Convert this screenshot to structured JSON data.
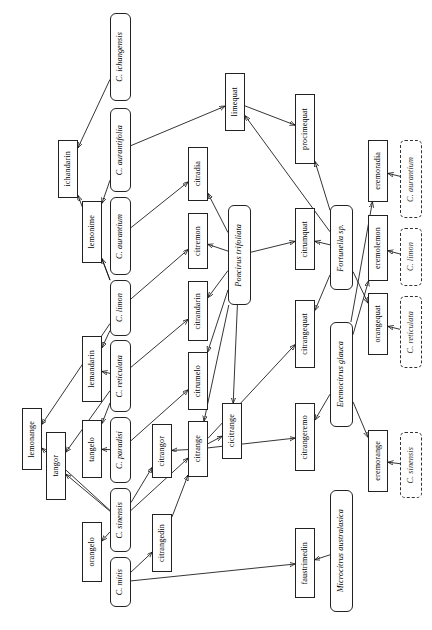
{
  "diagram": {
    "orientation": "rotated-90",
    "node_types": {
      "species": "true species (rounded solid box, italic)",
      "hybrid": "hybrid / cultivar (square solid box, roman)",
      "ghost": "repeated parent reference (dashed box, italic)"
    },
    "nodes": [
      {
        "id": "c_ichangensis",
        "label": "C. ichangensis",
        "type": "species",
        "x": 110,
        "y": 13,
        "w": 21,
        "h": 88
      },
      {
        "id": "c_aurantifolia",
        "label": "C. aurantifolia",
        "type": "species",
        "x": 110,
        "y": 108,
        "w": 21,
        "h": 84
      },
      {
        "id": "c_aurantium",
        "label": "C. aurantium",
        "type": "species",
        "x": 110,
        "y": 197,
        "w": 21,
        "h": 78
      },
      {
        "id": "c_limon",
        "label": "C. limon",
        "type": "species",
        "x": 110,
        "y": 280,
        "w": 21,
        "h": 56
      },
      {
        "id": "c_reticulata",
        "label": "C. reticulata",
        "type": "species",
        "x": 110,
        "y": 340,
        "w": 21,
        "h": 72
      },
      {
        "id": "c_paradisi",
        "label": "C. paradisi",
        "type": "species",
        "x": 110,
        "y": 417,
        "w": 21,
        "h": 66
      },
      {
        "id": "c_sinensis",
        "label": "C. sinensis",
        "type": "species",
        "x": 110,
        "y": 488,
        "w": 21,
        "h": 64
      },
      {
        "id": "c_mitis",
        "label": "C. mitis",
        "type": "species",
        "x": 110,
        "y": 557,
        "w": 21,
        "h": 50
      },
      {
        "id": "ichandarin",
        "label": "ichandarin",
        "type": "hybrid",
        "x": 58,
        "y": 140,
        "w": 20,
        "h": 58
      },
      {
        "id": "lemonime",
        "label": "lemonime",
        "type": "hybrid",
        "x": 82,
        "y": 201,
        "w": 20,
        "h": 62
      },
      {
        "id": "lemandarin",
        "label": "lemandarin",
        "type": "hybrid",
        "x": 82,
        "y": 336,
        "w": 20,
        "h": 66
      },
      {
        "id": "lemonange",
        "label": "lemonange",
        "type": "hybrid",
        "x": 22,
        "y": 408,
        "w": 20,
        "h": 62
      },
      {
        "id": "tangor",
        "label": "tangor",
        "type": "hybrid",
        "x": 46,
        "y": 432,
        "w": 20,
        "h": 68
      },
      {
        "id": "tangelo",
        "label": "tangelo",
        "type": "hybrid",
        "x": 82,
        "y": 420,
        "w": 20,
        "h": 58
      },
      {
        "id": "orangelo",
        "label": "orangelo",
        "type": "hybrid",
        "x": 82,
        "y": 522,
        "w": 20,
        "h": 60
      },
      {
        "id": "citradia",
        "label": "citradia",
        "type": "hybrid",
        "x": 188,
        "y": 147,
        "w": 20,
        "h": 54
      },
      {
        "id": "citremon",
        "label": "citremon",
        "type": "hybrid",
        "x": 188,
        "y": 213,
        "w": 20,
        "h": 56
      },
      {
        "id": "citrandarin",
        "label": "citrandarin",
        "type": "hybrid",
        "x": 188,
        "y": 281,
        "w": 20,
        "h": 60
      },
      {
        "id": "citrumelo",
        "label": "citrumelo",
        "type": "hybrid",
        "x": 188,
        "y": 352,
        "w": 20,
        "h": 58
      },
      {
        "id": "citrange",
        "label": "citrange",
        "type": "hybrid",
        "x": 188,
        "y": 421,
        "w": 20,
        "h": 56
      },
      {
        "id": "cicitrange",
        "label": "cicitrange",
        "type": "hybrid",
        "x": 222,
        "y": 403,
        "w": 20,
        "h": 56
      },
      {
        "id": "citrangor",
        "label": "citrangor",
        "type": "hybrid",
        "x": 152,
        "y": 424,
        "w": 20,
        "h": 54
      },
      {
        "id": "citrangedin",
        "label": "citrangedin",
        "type": "hybrid",
        "x": 152,
        "y": 514,
        "w": 20,
        "h": 58
      },
      {
        "id": "poncirus",
        "label": "Poncirus trifoliata",
        "type": "species",
        "x": 228,
        "y": 205,
        "w": 23,
        "h": 100
      },
      {
        "id": "fortunella",
        "label": "Fortunella sp.",
        "type": "species",
        "x": 330,
        "y": 205,
        "w": 23,
        "h": 85
      },
      {
        "id": "eremocitrus",
        "label": "Eremocitrus glauca",
        "type": "species",
        "x": 330,
        "y": 322,
        "w": 23,
        "h": 105
      },
      {
        "id": "microcitrus",
        "label": "Microcitrus australasica",
        "type": "species",
        "x": 330,
        "y": 490,
        "w": 23,
        "h": 122
      },
      {
        "id": "limequat",
        "label": "limequat",
        "type": "hybrid",
        "x": 225,
        "y": 73,
        "w": 20,
        "h": 58
      },
      {
        "id": "procimequat",
        "label": "procimequat",
        "type": "hybrid",
        "x": 295,
        "y": 94,
        "w": 20,
        "h": 70
      },
      {
        "id": "citrumquat",
        "label": "citrumquat",
        "type": "hybrid",
        "x": 295,
        "y": 208,
        "w": 20,
        "h": 62
      },
      {
        "id": "citrangequat",
        "label": "citrangequat",
        "type": "hybrid",
        "x": 295,
        "y": 300,
        "w": 20,
        "h": 68
      },
      {
        "id": "citrangeremo",
        "label": "citrangeremo",
        "type": "hybrid",
        "x": 295,
        "y": 403,
        "w": 20,
        "h": 68
      },
      {
        "id": "faustrimedin",
        "label": "faustrimedin",
        "type": "hybrid",
        "x": 295,
        "y": 528,
        "w": 20,
        "h": 70
      },
      {
        "id": "eremoradia",
        "label": "eremoradia",
        "type": "hybrid",
        "x": 368,
        "y": 140,
        "w": 20,
        "h": 62
      },
      {
        "id": "eremolemon",
        "label": "eremolemon",
        "type": "hybrid",
        "x": 368,
        "y": 215,
        "w": 20,
        "h": 66
      },
      {
        "id": "orangequat",
        "label": "orangequat",
        "type": "hybrid",
        "x": 368,
        "y": 293,
        "w": 20,
        "h": 62
      },
      {
        "id": "eremorange",
        "label": "eremorange",
        "type": "hybrid",
        "x": 368,
        "y": 430,
        "w": 20,
        "h": 62
      },
      {
        "id": "ghost_aurantium",
        "label": "C. aurantium",
        "type": "ghost",
        "x": 400,
        "y": 140,
        "w": 22,
        "h": 78
      },
      {
        "id": "ghost_limon",
        "label": "C. limon",
        "type": "ghost",
        "x": 400,
        "y": 228,
        "w": 22,
        "h": 58
      },
      {
        "id": "ghost_reticulata",
        "label": "C. reticulata",
        "type": "ghost",
        "x": 400,
        "y": 296,
        "w": 22,
        "h": 72
      },
      {
        "id": "ghost_sinensis",
        "label": "C. sinensis",
        "type": "ghost",
        "x": 400,
        "y": 432,
        "w": 22,
        "h": 66
      }
    ],
    "edges": [
      {
        "from": "c_ichangensis",
        "to": "ichandarin"
      },
      {
        "from": "c_aurantifolia",
        "to": "lemonime"
      },
      {
        "from": "c_aurantifolia",
        "to": "limequat"
      },
      {
        "from": "c_limon",
        "to": "ichandarin"
      },
      {
        "from": "c_limon",
        "to": "lemonime"
      },
      {
        "from": "c_limon",
        "to": "citremon"
      },
      {
        "from": "c_limon",
        "to": "lemandarin"
      },
      {
        "from": "c_limon",
        "to": "lemonange"
      },
      {
        "from": "c_reticulata",
        "to": "lemandarin"
      },
      {
        "from": "c_reticulata",
        "to": "citrandarin"
      },
      {
        "from": "c_reticulata",
        "to": "tangelo"
      },
      {
        "from": "c_reticulata",
        "to": "tangor"
      },
      {
        "from": "c_aurantium",
        "to": "citradia"
      },
      {
        "from": "c_paradisi",
        "to": "tangelo"
      },
      {
        "from": "c_paradisi",
        "to": "citrumelo"
      },
      {
        "from": "c_sinensis",
        "to": "orangelo"
      },
      {
        "from": "c_sinensis",
        "to": "tangor"
      },
      {
        "from": "c_sinensis",
        "to": "lemonange"
      },
      {
        "from": "c_sinensis",
        "to": "citrange"
      },
      {
        "from": "c_sinensis",
        "to": "citrangor"
      },
      {
        "from": "c_mitis",
        "to": "citrangedin"
      },
      {
        "from": "c_mitis",
        "to": "faustrimedin"
      },
      {
        "from": "poncirus",
        "to": "citradia"
      },
      {
        "from": "poncirus",
        "to": "citremon"
      },
      {
        "from": "poncirus",
        "to": "citrandarin"
      },
      {
        "from": "poncirus",
        "to": "citrumelo"
      },
      {
        "from": "poncirus",
        "to": "citrange"
      },
      {
        "from": "poncirus",
        "to": "cicitrange"
      },
      {
        "from": "poncirus",
        "to": "citrumquat"
      },
      {
        "from": "citrange",
        "to": "citrangor"
      },
      {
        "from": "citrange",
        "to": "cicitrange"
      },
      {
        "from": "citrange",
        "to": "citrangequat"
      },
      {
        "from": "citrange",
        "to": "citrangeremo"
      },
      {
        "from": "citrangedin",
        "to": "citrange"
      },
      {
        "from": "fortunella",
        "to": "limequat"
      },
      {
        "from": "fortunella",
        "to": "procimequat"
      },
      {
        "from": "fortunella",
        "to": "citrumquat"
      },
      {
        "from": "fortunella",
        "to": "citrangequat"
      },
      {
        "from": "fortunella",
        "to": "orangequat"
      },
      {
        "from": "limequat",
        "to": "procimequat"
      },
      {
        "from": "eremocitrus",
        "to": "eremoradia"
      },
      {
        "from": "eremocitrus",
        "to": "eremolemon"
      },
      {
        "from": "eremocitrus",
        "to": "citrangeremo"
      },
      {
        "from": "eremocitrus",
        "to": "eremorange"
      },
      {
        "from": "microcitrus",
        "to": "faustrimedin"
      },
      {
        "from": "ghost_aurantium",
        "to": "eremoradia"
      },
      {
        "from": "ghost_limon",
        "to": "eremolemon"
      },
      {
        "from": "ghost_reticulata",
        "to": "orangequat"
      },
      {
        "from": "ghost_sinensis",
        "to": "eremorange"
      }
    ]
  }
}
